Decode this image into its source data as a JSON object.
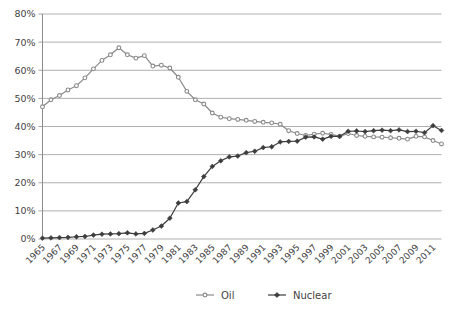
{
  "chart_data": {
    "type": "line",
    "title": "",
    "subtitle": "",
    "xlabel": "",
    "ylabel": "",
    "ylim": [
      0,
      80
    ],
    "ytick_labels": [
      "0%",
      "10%",
      "20%",
      "30%",
      "40%",
      "50%",
      "60%",
      "70%",
      "80%"
    ],
    "ytick_values": [
      0,
      10,
      20,
      30,
      40,
      50,
      60,
      70,
      80
    ],
    "grid": true,
    "legend_position": "bottom",
    "x": [
      1965,
      1966,
      1967,
      1968,
      1969,
      1970,
      1971,
      1972,
      1973,
      1974,
      1975,
      1976,
      1977,
      1978,
      1979,
      1980,
      1981,
      1982,
      1983,
      1984,
      1985,
      1986,
      1987,
      1988,
      1989,
      1990,
      1991,
      1992,
      1993,
      1994,
      1995,
      1996,
      1997,
      1998,
      1999,
      2000,
      2001,
      2002,
      2003,
      2004,
      2005,
      2006,
      2007,
      2008,
      2009,
      2010,
      2011,
      2012
    ],
    "xtick_labels": [
      "1965",
      "1967",
      "1969",
      "1971",
      "1973",
      "1975",
      "1977",
      "1979",
      "1981",
      "1983",
      "1985",
      "1987",
      "1989",
      "1991",
      "1993",
      "1995",
      "1997",
      "1999",
      "2001",
      "2003",
      "2005",
      "2007",
      "2009",
      "2011"
    ],
    "series": [
      {
        "name": "Oil",
        "color": "#8a8a8a",
        "marker": "circle-open",
        "values": [
          47,
          49.5,
          51,
          53,
          54.5,
          57.3,
          60.5,
          63.5,
          65.5,
          68,
          65.5,
          64.3,
          65.2,
          61.5,
          61.8,
          60.8,
          57.5,
          52.5,
          49.5,
          48,
          44.8,
          43.3,
          42.8,
          42.5,
          42.2,
          41.8,
          41.5,
          41.3,
          40.8,
          38.5,
          37.5,
          36.8,
          37.3,
          37.6,
          37.2,
          36.5,
          37.5,
          36.8,
          36.5,
          36.3,
          36.2,
          36,
          35.8,
          35.5,
          36.5,
          36.3,
          35,
          33.8
        ]
      },
      {
        "name": "Nuclear",
        "color": "#3d3d3d",
        "marker": "diamond-filled",
        "values": [
          0.3,
          0.4,
          0.5,
          0.6,
          0.8,
          0.9,
          1.4,
          1.7,
          1.8,
          1.9,
          2.2,
          1.8,
          2.0,
          3.2,
          4.6,
          7.4,
          12.8,
          13.3,
          17.5,
          22.2,
          25.8,
          27.8,
          29.2,
          29.5,
          30.7,
          31.2,
          32.5,
          32.8,
          34.5,
          34.7,
          34.8,
          36.2,
          36.3,
          35.5,
          36.5,
          36.5,
          38.3,
          38.4,
          38.2,
          38.5,
          38.7,
          38.5,
          38.8,
          38.2,
          38.3,
          37.8,
          40.3,
          38.6
        ]
      }
    ]
  },
  "legend": {
    "items": [
      {
        "label": "Oil"
      },
      {
        "label": "Nuclear"
      }
    ]
  }
}
